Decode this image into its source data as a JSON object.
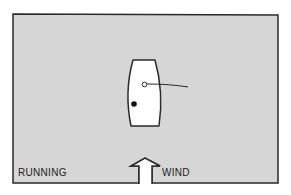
{
  "diagram": {
    "title": "Running",
    "labels": {
      "point_of_sail": "RUNNING",
      "wind": "WIND"
    },
    "elements": {
      "boat": "boat-hull (top view)",
      "mast": "hollow circle",
      "boom_sail": "curved line extending to starboard",
      "crew": "filled black dot",
      "wind_arrow": "outlined arrow pointing up from bottom edge"
    },
    "colors": {
      "background_panel": "#d6d6d6",
      "outline": "#2a2a2a",
      "boat_fill": "#ffffff",
      "crew": "#111111"
    }
  }
}
